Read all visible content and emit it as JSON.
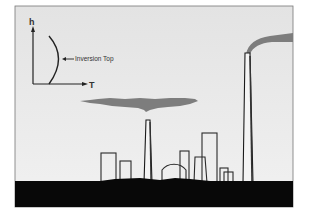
{
  "figure": {
    "colors": {
      "sky_top": "#e4e4e4",
      "sky_bottom": "#f0f0f0",
      "frame": "#666666",
      "ground": "#080808",
      "smoke": "#7d7d7d",
      "outline": "#2a2a2a"
    }
  },
  "inset_graph": {
    "y_axis_label": "h",
    "x_axis_label": "T",
    "annotation": "Inversion Top"
  },
  "elements": {
    "short_stack": "short smokestack",
    "tall_stack": "tall smokestack",
    "trapped_smoke": "smoke layer trapped under inversion",
    "plume": "plume above inversion",
    "buildings": [
      "building-1",
      "building-2",
      "dome",
      "building-3",
      "building-4",
      "building-5",
      "building-6"
    ]
  }
}
